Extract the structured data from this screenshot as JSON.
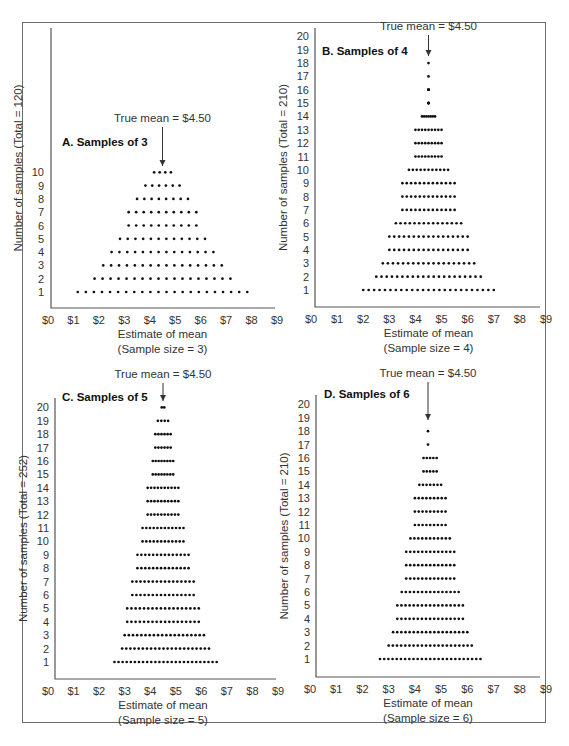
{
  "figure": {
    "mean_label": "True mean = $4.50",
    "x_ticks": [
      "$0",
      "$1",
      "$2",
      "$3",
      "$4",
      "$5",
      "$6",
      "$7",
      "$8",
      "$9"
    ],
    "xlabel": "Estimate of mean"
  },
  "chart_data": [
    {
      "type": "scatter",
      "subtype": "dot-plot",
      "title": "A. Samples of 3",
      "xlabel": "Estimate of mean",
      "xlabel_sub": "(Sample size = 3)",
      "ylabel": "Number of samples (Total = 120)",
      "xlim": [
        0,
        9
      ],
      "y_ticks": [
        "1",
        "2",
        "3",
        "4",
        "5",
        "6",
        "7",
        "8",
        "9",
        "10"
      ],
      "annotation": "True mean = $4.50",
      "true_mean": 4.5,
      "row_counts": [
        22,
        18,
        16,
        14,
        12,
        10,
        10,
        8,
        6,
        4
      ],
      "row_ranges": [
        [
          1.17,
          7.83
        ],
        [
          1.83,
          7.17
        ],
        [
          2.17,
          6.83
        ],
        [
          2.5,
          6.5
        ],
        [
          2.83,
          6.17
        ],
        [
          3.17,
          5.83
        ],
        [
          3.17,
          5.83
        ],
        [
          3.5,
          5.5
        ],
        [
          3.83,
          5.17
        ],
        [
          4.17,
          4.83
        ]
      ],
      "total": 120
    },
    {
      "type": "scatter",
      "subtype": "dot-plot",
      "title": "B. Samples of 4",
      "xlabel": "Estimate of mean",
      "xlabel_sub": "(Sample size = 4)",
      "ylabel": "Number of samples (Total = 210)",
      "xlim": [
        0,
        9
      ],
      "y_ticks": [
        "1",
        "2",
        "3",
        "4",
        "5",
        "6",
        "7",
        "8",
        "9",
        "10",
        "11",
        "12",
        "13",
        "14",
        "15",
        "16",
        "17",
        "18",
        "19",
        "20"
      ],
      "annotation": "True mean = $4.50",
      "true_mean": 4.5,
      "row_counts": [
        25,
        21,
        19,
        17,
        17,
        15,
        13,
        13,
        13,
        11,
        9,
        9,
        9,
        7,
        5,
        5,
        1,
        1
      ],
      "row_ranges": [
        [
          2.0,
          7.0
        ],
        [
          2.5,
          6.5
        ],
        [
          2.75,
          6.25
        ],
        [
          3.0,
          6.0
        ],
        [
          3.0,
          6.0
        ],
        [
          3.25,
          5.75
        ],
        [
          3.5,
          5.5
        ],
        [
          3.5,
          5.5
        ],
        [
          3.5,
          5.5
        ],
        [
          3.75,
          5.25
        ],
        [
          4.0,
          5.0
        ],
        [
          4.0,
          5.0
        ],
        [
          4.0,
          5.0
        ],
        [
          4.25,
          4.75
        ],
        [
          4.5,
          4.5
        ],
        [
          4.5,
          4.5
        ],
        [
          4.5,
          4.5
        ],
        [
          4.5,
          4.5
        ]
      ],
      "total": 210
    },
    {
      "type": "scatter",
      "subtype": "dot-plot",
      "title": "C. Samples of 5",
      "xlabel": "Estimate of mean",
      "xlabel_sub": "(Sample size = 5)",
      "ylabel": "Number of samples (Total = 252)",
      "xlim": [
        0,
        9
      ],
      "y_ticks": [
        "1",
        "2",
        "3",
        "4",
        "5",
        "6",
        "7",
        "8",
        "9",
        "10",
        "11",
        "12",
        "13",
        "14",
        "15",
        "16",
        "17",
        "18",
        "19",
        "20"
      ],
      "annotation": "True mean = $4.50",
      "true_mean": 4.5,
      "row_counts": [
        26,
        22,
        20,
        18,
        18,
        16,
        16,
        14,
        14,
        12,
        12,
        10,
        10,
        10,
        8,
        8,
        6,
        6,
        4,
        2
      ],
      "row_ranges": [
        [
          2.6,
          6.6
        ],
        [
          2.9,
          6.3
        ],
        [
          3.0,
          6.1
        ],
        [
          3.1,
          5.9
        ],
        [
          3.1,
          5.9
        ],
        [
          3.3,
          5.7
        ],
        [
          3.3,
          5.7
        ],
        [
          3.5,
          5.5
        ],
        [
          3.5,
          5.5
        ],
        [
          3.7,
          5.3
        ],
        [
          3.7,
          5.3
        ],
        [
          3.9,
          5.1
        ],
        [
          3.9,
          5.1
        ],
        [
          3.9,
          5.1
        ],
        [
          4.1,
          4.9
        ],
        [
          4.1,
          4.9
        ],
        [
          4.2,
          4.8
        ],
        [
          4.2,
          4.8
        ],
        [
          4.3,
          4.7
        ],
        [
          4.45,
          4.55
        ]
      ],
      "total": 252
    },
    {
      "type": "scatter",
      "subtype": "dot-plot",
      "title": "D. Samples of 6",
      "xlabel": "Estimate of mean",
      "xlabel_sub": "(Sample size = 6)",
      "ylabel": "Number of samples (Total = 210)",
      "xlim": [
        0,
        9
      ],
      "y_ticks": [
        "1",
        "2",
        "3",
        "4",
        "5",
        "6",
        "7",
        "8",
        "9",
        "10",
        "11",
        "12",
        "13",
        "14",
        "15",
        "16",
        "17",
        "18",
        "19",
        "20"
      ],
      "annotation": "True mean = $4.50",
      "true_mean": 4.5,
      "row_counts": [
        25,
        21,
        19,
        17,
        17,
        15,
        13,
        13,
        13,
        11,
        9,
        9,
        9,
        7,
        5,
        5,
        1,
        1
      ],
      "row_ranges": [
        [
          2.67,
          6.5
        ],
        [
          3.0,
          6.17
        ],
        [
          3.17,
          6.0
        ],
        [
          3.33,
          5.83
        ],
        [
          3.33,
          5.83
        ],
        [
          3.5,
          5.67
        ],
        [
          3.67,
          5.5
        ],
        [
          3.67,
          5.5
        ],
        [
          3.67,
          5.5
        ],
        [
          3.83,
          5.33
        ],
        [
          4.0,
          5.17
        ],
        [
          4.0,
          5.17
        ],
        [
          4.0,
          5.17
        ],
        [
          4.17,
          5.0
        ],
        [
          4.33,
          4.83
        ],
        [
          4.33,
          4.83
        ],
        [
          4.5,
          4.5
        ],
        [
          4.5,
          4.5
        ]
      ],
      "total": 210
    }
  ],
  "layout": {
    "panels": [
      {
        "yaxis_x": 51,
        "yaxis_top": 28,
        "xaxis_y": 308,
        "xaxis_right": 275,
        "x0": 48,
        "x9": 277,
        "row1_y": 292,
        "row_step": 13.3,
        "title_x": 62,
        "title_y": 146,
        "mean_text_y": 122,
        "arrow_top": 127,
        "arrow_bottom": 166,
        "ytick_x": 44
      },
      {
        "yaxis_x": 315,
        "yaxis_top": 28,
        "xaxis_y": 307,
        "xaxis_right": 540,
        "x0": 311,
        "x9": 546,
        "row1_y": 290,
        "row_step": 13.35,
        "title_x": 322,
        "title_y": 55,
        "mean_text_y": 30,
        "arrow_top": 35,
        "arrow_bottom": 56,
        "ytick_x": 309
      },
      {
        "yaxis_x": 55,
        "yaxis_top": 398,
        "xaxis_y": 679,
        "xaxis_right": 276,
        "x0": 48,
        "x9": 278,
        "row1_y": 662,
        "row_step": 13.4,
        "title_x": 62,
        "title_y": 401,
        "mean_text_y": 378,
        "arrow_top": 383,
        "arrow_bottom": 401,
        "ytick_x": 49
      },
      {
        "yaxis_x": 316,
        "yaxis_top": 395,
        "xaxis_y": 677,
        "xaxis_right": 540,
        "x0": 310,
        "x9": 546,
        "row1_y": 659,
        "row_step": 13.4,
        "title_x": 324,
        "title_y": 398,
        "mean_text_y": 377,
        "arrow_top": 382,
        "arrow_bottom": 420,
        "ytick_x": 310
      }
    ],
    "xlabel_offset": 30,
    "xlabel_sub_offset": 45,
    "tick_label_offset": 16
  }
}
